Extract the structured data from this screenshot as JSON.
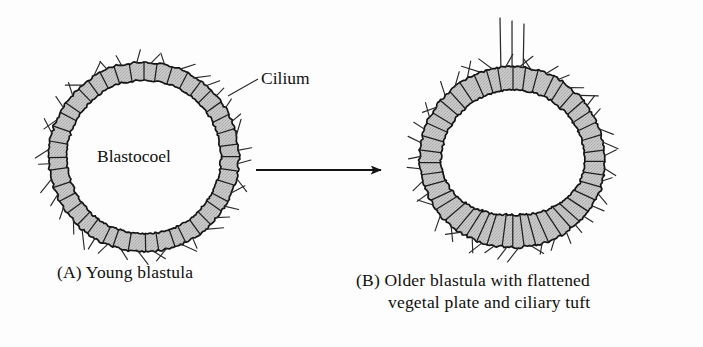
{
  "figure": {
    "background_color": "#fdfdfd",
    "width": 703,
    "height": 347
  },
  "labels": {
    "cilium": "Cilium",
    "blastocoel": "Blastocoel"
  },
  "captions": {
    "panel_a": "(A) Young blastula",
    "panel_b_line1": "(B) Older blastula with flattened",
    "panel_b_line2": "vegetal plate and ciliary tuft"
  },
  "icons": {
    "transition_arrow": "arrow-right-icon",
    "leader_line": "leader-line-icon"
  },
  "diagram": {
    "stroke_color": "#1a1a1a",
    "cell_fill_color": "#c6c6c6",
    "cilium_color": "#2a2a2a",
    "panel_a": {
      "name": "young-blastula",
      "center_x": 144,
      "center_y": 157,
      "outer_radius": 95,
      "inner_radius": 77,
      "cell_count": 40,
      "cilia_count": 40,
      "cilium_length": 11,
      "shape": "circle"
    },
    "panel_b": {
      "name": "older-blastula",
      "center_x": 513,
      "center_y": 162,
      "outer_radius": 92,
      "inner_radius": 72,
      "cell_count": 44,
      "cilia_count": 44,
      "cilium_length": 11,
      "shape": "flattened-vegetal-plate",
      "vegetal_plate_flattening": 0.17,
      "ciliary_tuft": {
        "count": 3,
        "x_positions": [
          500,
          512,
          524
        ],
        "top_y": 18,
        "base_y": 72
      }
    },
    "arrow": {
      "x1": 256,
      "y1": 170,
      "x2": 396,
      "y2": 170,
      "head_length": 15,
      "head_width": 10
    },
    "leader": {
      "x1": 258,
      "y1": 79,
      "x2": 228,
      "y2": 96
    }
  }
}
